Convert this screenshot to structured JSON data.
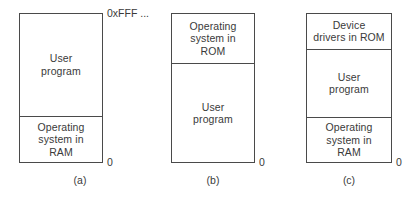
{
  "figure": {
    "top_address_label": "0xFFF ...",
    "zero_address_label": "0",
    "panels": [
      {
        "id": "a",
        "caption": "(a)",
        "regions": [
          {
            "name": "user-program",
            "label": "User\nprogram"
          },
          {
            "name": "operating-system-ram",
            "label": "Operating\nsystem in\nRAM"
          }
        ]
      },
      {
        "id": "b",
        "caption": "(b)",
        "regions": [
          {
            "name": "operating-system-rom",
            "label": "Operating\nsystem in\nROM"
          },
          {
            "name": "user-program",
            "label": "User\nprogram"
          }
        ]
      },
      {
        "id": "c",
        "caption": "(c)",
        "regions": [
          {
            "name": "device-drivers-rom",
            "label": "Device\ndrivers in ROM"
          },
          {
            "name": "user-program",
            "label": "User\nprogram"
          },
          {
            "name": "operating-system-ram",
            "label": "Operating\nsystem in\nRAM"
          }
        ]
      }
    ]
  },
  "colors": {
    "background": "#ffffff",
    "stroke": "#4a4a4a",
    "text": "#3a3a3a"
  }
}
